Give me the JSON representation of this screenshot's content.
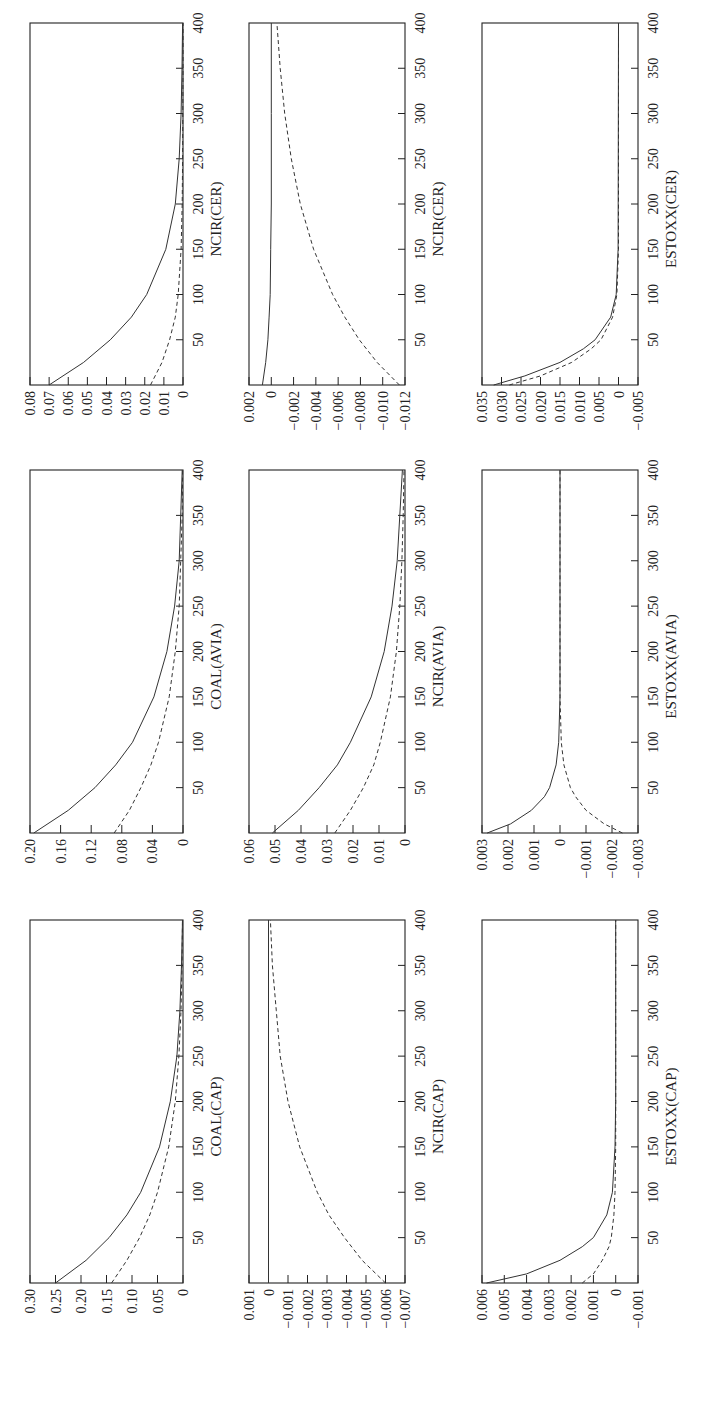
{
  "figure": {
    "orientation": "rotated 90° counter-clockwise",
    "line_styles": {
      "solid": "response 1",
      "dashed": "response 2"
    }
  },
  "chart_data": [
    {
      "type": "line",
      "title": "",
      "xlabel": "COAL(CAP)",
      "ylabel": "",
      "xlim": [
        0,
        400
      ],
      "xticks": [
        50,
        100,
        150,
        200,
        250,
        300,
        350,
        400
      ],
      "ylim": [
        0,
        0.3
      ],
      "yticks": [
        "0.30",
        "0.25",
        "0.20",
        "0.15",
        "0.10",
        "0.05",
        "0"
      ],
      "ytick_values": [
        0.3,
        0.25,
        0.2,
        0.15,
        0.1,
        0.05,
        0
      ],
      "series": [
        {
          "name": "solid",
          "style": "solid",
          "x": [
            0,
            25,
            50,
            75,
            100,
            150,
            200,
            250,
            300,
            350,
            400
          ],
          "values": [
            0.25,
            0.19,
            0.145,
            0.11,
            0.083,
            0.046,
            0.025,
            0.012,
            0.006,
            0.003,
            0.001
          ]
        },
        {
          "name": "dashed",
          "style": "dashed",
          "x": [
            0,
            25,
            50,
            75,
            100,
            150,
            200,
            250,
            300,
            350,
            400
          ],
          "values": [
            0.14,
            0.11,
            0.085,
            0.065,
            0.05,
            0.028,
            0.015,
            0.008,
            0.004,
            0.002,
            0.001
          ]
        }
      ],
      "grid": false,
      "position": {
        "col": 0,
        "row": 2
      }
    },
    {
      "type": "line",
      "title": "",
      "xlabel": "COAL(AVIA)",
      "ylabel": "",
      "xlim": [
        0,
        400
      ],
      "xticks": [
        50,
        100,
        150,
        200,
        250,
        300,
        350,
        400
      ],
      "ylim": [
        0,
        0.2
      ],
      "yticks": [
        "0.20",
        "0.16",
        "0.12",
        "0.08",
        "0.04",
        "0"
      ],
      "ytick_values": [
        0.2,
        0.16,
        0.12,
        0.08,
        0.04,
        0
      ],
      "series": [
        {
          "name": "solid",
          "style": "solid",
          "x": [
            0,
            25,
            50,
            75,
            100,
            150,
            200,
            250,
            300,
            350,
            400
          ],
          "values": [
            0.195,
            0.15,
            0.115,
            0.088,
            0.066,
            0.038,
            0.021,
            0.011,
            0.005,
            0.003,
            0.001
          ]
        },
        {
          "name": "dashed",
          "style": "dashed",
          "x": [
            0,
            25,
            50,
            75,
            100,
            150,
            200,
            250,
            300,
            350,
            400
          ],
          "values": [
            0.09,
            0.07,
            0.055,
            0.042,
            0.032,
            0.018,
            0.01,
            0.005,
            0.003,
            0.001,
            0.0005
          ]
        }
      ],
      "grid": false,
      "position": {
        "col": 0,
        "row": 1
      }
    },
    {
      "type": "line",
      "title": "",
      "xlabel": "NCIR(CER)",
      "ylabel": "",
      "xlim": [
        0,
        400
      ],
      "xticks": [
        50,
        100,
        150,
        200,
        250,
        300,
        350,
        400
      ],
      "ylim": [
        0,
        0.08
      ],
      "yticks": [
        "0.08",
        "0.07",
        "0.06",
        "0.05",
        "0.04",
        "0.03",
        "0.02",
        "0.01",
        "0"
      ],
      "ytick_values": [
        0.08,
        0.07,
        0.06,
        0.05,
        0.04,
        0.03,
        0.02,
        0.01,
        0
      ],
      "series": [
        {
          "name": "solid",
          "style": "solid",
          "x": [
            0,
            25,
            50,
            75,
            100,
            150,
            200,
            250,
            300,
            350,
            400
          ],
          "values": [
            0.07,
            0.052,
            0.038,
            0.027,
            0.019,
            0.009,
            0.004,
            0.002,
            0.001,
            0.0005,
            0.0002
          ]
        },
        {
          "name": "dashed",
          "style": "dashed",
          "x": [
            0,
            25,
            50,
            75,
            100,
            150,
            200,
            250,
            300,
            350,
            400
          ],
          "values": [
            0.017,
            0.011,
            0.007,
            0.004,
            0.0025,
            0.001,
            0.0004,
            0.0002,
            0.0001,
            0,
            0
          ]
        }
      ],
      "grid": false,
      "position": {
        "col": 0,
        "row": 0
      }
    },
    {
      "type": "line",
      "title": "",
      "xlabel": "NCIR(CAP)",
      "ylabel": "",
      "xlim": [
        0,
        400
      ],
      "xticks": [
        50,
        100,
        150,
        200,
        250,
        300,
        350,
        400
      ],
      "ylim": [
        -0.007,
        0.001
      ],
      "yticks": [
        "0.001",
        "0",
        "−0.001",
        "−0.002",
        "−0.003",
        "−0.004",
        "−0.005",
        "−0.006",
        "−0.007"
      ],
      "ytick_values": [
        0.001,
        0,
        -0.001,
        -0.002,
        -0.003,
        -0.004,
        -0.005,
        -0.006,
        -0.007
      ],
      "series": [
        {
          "name": "solid",
          "style": "solid",
          "x": [
            0,
            400
          ],
          "values": [
            0,
            0
          ]
        },
        {
          "name": "dashed",
          "style": "dashed",
          "x": [
            0,
            25,
            50,
            75,
            100,
            150,
            200,
            250,
            300,
            350,
            400
          ],
          "values": [
            -0.006,
            -0.0048,
            -0.0039,
            -0.0031,
            -0.0025,
            -0.0016,
            -0.001,
            -0.0006,
            -0.0004,
            -0.0002,
            -0.0001
          ]
        }
      ],
      "grid": false,
      "position": {
        "col": 1,
        "row": 2
      }
    },
    {
      "type": "line",
      "title": "",
      "xlabel": "NCIR(AVIA)",
      "ylabel": "",
      "xlim": [
        0,
        400
      ],
      "xticks": [
        50,
        100,
        150,
        200,
        250,
        300,
        350,
        400
      ],
      "ylim": [
        0,
        0.06
      ],
      "yticks": [
        "0.06",
        "0.05",
        "0.04",
        "0.03",
        "0.02",
        "0.01",
        "0"
      ],
      "ytick_values": [
        0.06,
        0.05,
        0.04,
        0.03,
        0.02,
        0.01,
        0
      ],
      "series": [
        {
          "name": "solid",
          "style": "solid",
          "x": [
            0,
            25,
            50,
            75,
            100,
            150,
            200,
            250,
            300,
            350,
            400
          ],
          "values": [
            0.051,
            0.041,
            0.033,
            0.026,
            0.021,
            0.013,
            0.008,
            0.005,
            0.003,
            0.002,
            0.001
          ]
        },
        {
          "name": "dashed",
          "style": "dashed",
          "x": [
            0,
            25,
            50,
            75,
            100,
            150,
            200,
            250,
            300,
            350,
            400
          ],
          "values": [
            0.027,
            0.021,
            0.016,
            0.012,
            0.0095,
            0.0056,
            0.0033,
            0.002,
            0.0012,
            0.0007,
            0.0004
          ]
        }
      ],
      "grid": false,
      "position": {
        "col": 1,
        "row": 1
      }
    },
    {
      "type": "line",
      "title": "",
      "xlabel": "NCIR(CER)",
      "ylabel": "",
      "xlim": [
        0,
        400
      ],
      "xticks": [
        50,
        100,
        150,
        200,
        250,
        300,
        350,
        400
      ],
      "ylim": [
        -0.012,
        0.002
      ],
      "yticks": [
        "0.002",
        "0",
        "−0.002",
        "−0.004",
        "−0.006",
        "−0.008",
        "−0.010",
        "−0.012"
      ],
      "ytick_values": [
        0.002,
        0,
        -0.002,
        -0.004,
        -0.006,
        -0.008,
        -0.01,
        -0.012
      ],
      "series": [
        {
          "name": "solid",
          "style": "solid",
          "x": [
            0,
            25,
            50,
            75,
            100,
            150,
            200,
            300,
            400
          ],
          "values": [
            0.0008,
            0.0005,
            0.0003,
            0.0002,
            0.0001,
            5e-05,
            0,
            0,
            0
          ]
        },
        {
          "name": "dashed",
          "style": "dashed",
          "x": [
            0,
            25,
            50,
            75,
            100,
            150,
            200,
            250,
            300,
            350,
            400
          ],
          "values": [
            -0.0115,
            -0.0095,
            -0.0079,
            -0.0066,
            -0.0055,
            -0.0038,
            -0.0026,
            -0.0018,
            -0.0012,
            -0.0008,
            -0.0005
          ]
        }
      ],
      "grid": false,
      "position": {
        "col": 1,
        "row": 0
      }
    },
    {
      "type": "line",
      "title": "",
      "xlabel": "ESTOXX(CAP)",
      "ylabel": "",
      "xlim": [
        0,
        400
      ],
      "xticks": [
        50,
        100,
        150,
        200,
        250,
        300,
        350,
        400
      ],
      "ylim": [
        -0.001,
        0.006
      ],
      "yticks": [
        "0.006",
        "0.005",
        "0.004",
        "0.003",
        "0.002",
        "0.001",
        "0",
        "−0.001"
      ],
      "ytick_values": [
        0.006,
        0.005,
        0.004,
        0.003,
        0.002,
        0.001,
        0,
        -0.001
      ],
      "series": [
        {
          "name": "solid",
          "style": "solid",
          "x": [
            0,
            10,
            25,
            40,
            50,
            75,
            100,
            150,
            200,
            400
          ],
          "values": [
            0.0058,
            0.004,
            0.0025,
            0.0015,
            0.001,
            0.0004,
            0.00015,
            3e-05,
            0,
            0
          ]
        },
        {
          "name": "dashed",
          "style": "dashed",
          "x": [
            0,
            10,
            25,
            40,
            50,
            75,
            100,
            150,
            200,
            400
          ],
          "values": [
            0.0015,
            0.001,
            0.0006,
            0.0003,
            0.0002,
            8e-05,
            3e-05,
            0,
            0,
            0
          ]
        }
      ],
      "grid": false,
      "position": {
        "col": 2,
        "row": 2
      }
    },
    {
      "type": "line",
      "title": "",
      "xlabel": "ESTOXX(AVIA)",
      "ylabel": "",
      "xlim": [
        0,
        400
      ],
      "xticks": [
        50,
        100,
        150,
        200,
        250,
        300,
        350,
        400
      ],
      "ylim": [
        -0.003,
        0.003
      ],
      "yticks": [
        "0.003",
        "0.002",
        "0.001",
        "0",
        "−0.001",
        "−0.002",
        "−0.003"
      ],
      "ytick_values": [
        0.003,
        0.002,
        0.001,
        0,
        -0.001,
        -0.002,
        -0.003
      ],
      "series": [
        {
          "name": "solid",
          "style": "solid",
          "x": [
            0,
            10,
            25,
            40,
            50,
            75,
            100,
            150,
            400
          ],
          "values": [
            0.0028,
            0.0019,
            0.0011,
            0.0006,
            0.0004,
            0.00015,
            5e-05,
            0,
            0
          ]
        },
        {
          "name": "dashed",
          "style": "dashed",
          "x": [
            0,
            10,
            25,
            40,
            50,
            75,
            100,
            150,
            400
          ],
          "values": [
            -0.0024,
            -0.0017,
            -0.001,
            -0.0006,
            -0.0004,
            -0.00015,
            -5e-05,
            0,
            0
          ]
        }
      ],
      "grid": false,
      "position": {
        "col": 2,
        "row": 1
      }
    },
    {
      "type": "line",
      "title": "",
      "xlabel": "ESTOXX(CER)",
      "ylabel": "",
      "xlim": [
        0,
        400
      ],
      "xticks": [
        50,
        100,
        150,
        200,
        250,
        300,
        350,
        400
      ],
      "ylim": [
        -0.005,
        0.035
      ],
      "yticks": [
        "0.035",
        "0.030",
        "0.025",
        "0.020",
        "0.015",
        "0.010",
        "0.005",
        "0",
        "−0.005"
      ],
      "ytick_values": [
        0.035,
        0.03,
        0.025,
        0.02,
        0.015,
        0.01,
        0.005,
        0,
        -0.005
      ],
      "series": [
        {
          "name": "solid",
          "style": "solid",
          "x": [
            0,
            10,
            25,
            40,
            50,
            75,
            100,
            150,
            400
          ],
          "values": [
            0.032,
            0.024,
            0.015,
            0.009,
            0.006,
            0.002,
            0.0006,
            0.0001,
            0
          ]
        },
        {
          "name": "dashed",
          "style": "dashed",
          "x": [
            0,
            10,
            25,
            40,
            50,
            75,
            100,
            150,
            400
          ],
          "values": [
            0.028,
            0.02,
            0.012,
            0.007,
            0.0045,
            0.0015,
            0.0004,
            0,
            0
          ]
        }
      ],
      "grid": false,
      "position": {
        "col": 2,
        "row": 0
      }
    }
  ]
}
